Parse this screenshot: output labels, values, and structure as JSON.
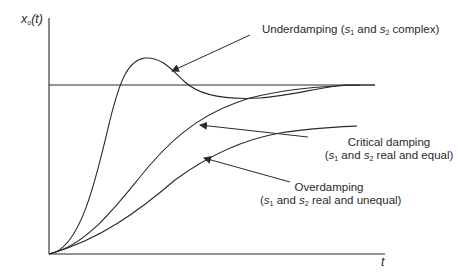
{
  "diagram": {
    "y_axis_label": {
      "var": "x",
      "sub": "o",
      "arg": "(t)"
    },
    "x_axis_label": "t",
    "colors": {
      "line": "#2a2a2a",
      "background": "#ffffff"
    },
    "annotations": {
      "underdamping": {
        "title": "Underdamping",
        "open": "(",
        "s1": "s",
        "s1_sub": "1",
        "mid": " and ",
        "s2": "s",
        "s2_sub": "2",
        "close": " complex)"
      },
      "critical": {
        "title": "Critical damping",
        "open": "(",
        "s1": "s",
        "s1_sub": "1",
        "mid": " and ",
        "s2": "s",
        "s2_sub": "2",
        "close": " real and equal)"
      },
      "overdamping": {
        "title": "Overdamping",
        "open": "(",
        "s1": "s",
        "s1_sub": "1",
        "mid": " and ",
        "s2": "s",
        "s2_sub": "2",
        "close": " real and unequal)"
      }
    },
    "curves": [
      "underdamped",
      "critically-damped",
      "overdamped",
      "steady-state-line"
    ]
  }
}
